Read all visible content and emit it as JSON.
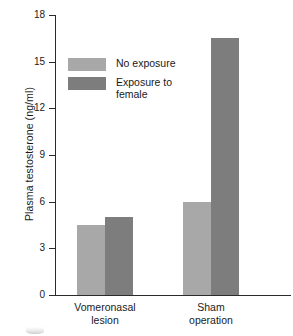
{
  "chart_data": {
    "type": "bar",
    "title": "",
    "xlabel": "",
    "ylabel": "Plasma testosterone (ng/ml)",
    "categories": [
      "Vomeronasal\nlesion",
      "Sham\noperation"
    ],
    "series": [
      {
        "name": "No exposure",
        "values": [
          4.5,
          6.0
        ],
        "color": "#a8a8a8"
      },
      {
        "name": "Exposure to\nfemale",
        "values": [
          5.0,
          16.5
        ],
        "color": "#7d7d7d"
      }
    ],
    "ylim": [
      0,
      18
    ],
    "yticks": [
      0,
      3,
      6,
      9,
      12,
      15,
      18
    ],
    "ytick_labels": [
      "0",
      "3",
      "6",
      "9",
      "12",
      "15",
      "18"
    ],
    "grid": false,
    "legend_position": "upper-left-inside"
  },
  "axis": {
    "y_title": "Plasma testosterone (ng/ml)"
  },
  "legend": {
    "entries": [
      {
        "label": "No exposure"
      },
      {
        "label": "Exposure to\nfemale"
      }
    ]
  },
  "categories": [
    {
      "label": "Vomeronasal\nlesion"
    },
    {
      "label": "Sham\noperation"
    }
  ],
  "ticks": [
    {
      "label": "18"
    },
    {
      "label": "15"
    },
    {
      "label": "12"
    },
    {
      "label": "9"
    },
    {
      "label": "6"
    },
    {
      "label": "3"
    },
    {
      "label": "0"
    }
  ]
}
